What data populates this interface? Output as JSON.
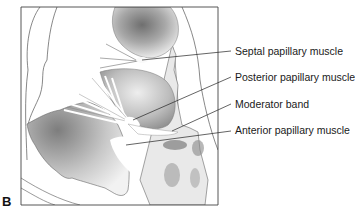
{
  "figure": {
    "panel_letter": "B",
    "labels": [
      {
        "id": "septal",
        "text": "Septal papillary muscle"
      },
      {
        "id": "posterior",
        "text": "Posterior papillary muscle"
      },
      {
        "id": "moderator",
        "text": "Moderator band"
      },
      {
        "id": "anterior",
        "text": "Anterior papillary muscle"
      }
    ]
  }
}
